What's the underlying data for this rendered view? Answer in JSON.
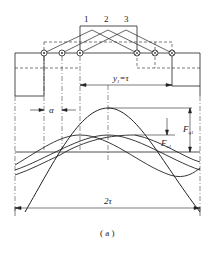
{
  "diagram": {
    "coil_labels": [
      "1",
      "2",
      "3"
    ],
    "pitch_label": "y",
    "pitch_sub": "1",
    "pitch_value": "=τ",
    "alpha_label": "α",
    "fq_label": "F",
    "fq_sub": "q1",
    "fc_label": "F",
    "fc_sub": "c1",
    "span_label": "2τ",
    "caption": "( a )",
    "colors": {
      "line": "#222222",
      "background": "#ffffff"
    }
  }
}
